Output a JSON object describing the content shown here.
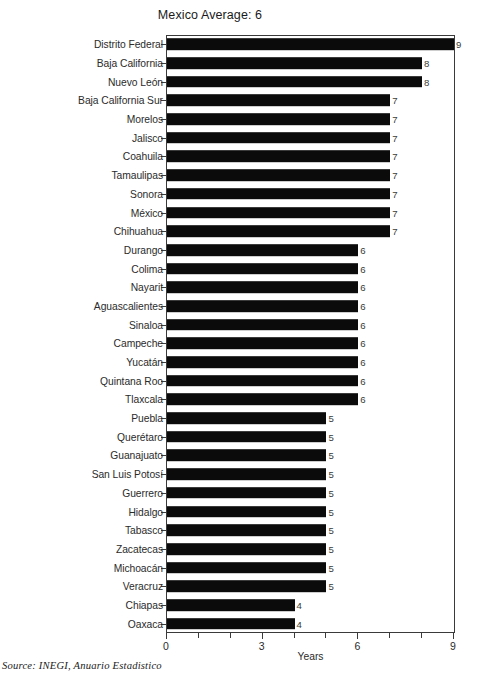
{
  "chart_data": {
    "type": "bar",
    "orientation": "horizontal",
    "title": "Mexico Average: 6",
    "xlabel": "Years",
    "ylabel": "",
    "xlim": [
      0,
      9
    ],
    "xticks": [
      0,
      1,
      2,
      3,
      4,
      5,
      6,
      7,
      8,
      9
    ],
    "xtick_labels": [
      "0",
      "",
      "",
      "3",
      "",
      "",
      "6",
      "",
      "",
      "9"
    ],
    "grid": false,
    "legend": null,
    "bar_color": "#0b0b0b",
    "show_value_labels": true,
    "categories": [
      "Distrito Federal",
      "Baja California",
      "Nuevo León",
      "Baja California Sur",
      "Morelos",
      "Jalisco",
      "Coahuila",
      "Tamaulipas",
      "Sonora",
      "México",
      "Chihuahua",
      "Durango",
      "Colima",
      "Nayarit",
      "Aguascalientes",
      "Sinaloa",
      "Campeche",
      "Yucatán",
      "Quintana Roo",
      "Tlaxcala",
      "Puebla",
      "Querétaro",
      "Guanajuato",
      "San Luis Potosí",
      "Guerrero",
      "Hidalgo",
      "Tabasco",
      "Zacatecas",
      "Michoacán",
      "Veracruz",
      "Chiapas",
      "Oaxaca"
    ],
    "values": [
      9,
      8,
      8,
      7,
      7,
      7,
      7,
      7,
      7,
      7,
      7,
      6,
      6,
      6,
      6,
      6,
      6,
      6,
      6,
      6,
      5,
      5,
      5,
      5,
      5,
      5,
      5,
      5,
      5,
      5,
      4,
      4
    ],
    "value_labels": [
      "9",
      "8",
      "8",
      "7",
      "7",
      "7",
      "7",
      "7",
      "7",
      "7",
      "7",
      "6",
      "6",
      "6",
      "6",
      "6",
      "6",
      "6",
      "6",
      "6",
      "5",
      "5",
      "5",
      "5",
      "5",
      "5",
      "5",
      "5",
      "5",
      "5",
      "4",
      "4"
    ],
    "annotation_mexico_average": 6
  },
  "source": {
    "text": "Source: INEGI,  Anuario Estadistico"
  }
}
